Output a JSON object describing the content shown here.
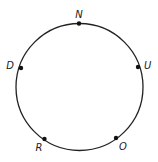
{
  "diagram": {
    "type": "circle-with-labeled-points",
    "circle": {
      "cx": 79.5,
      "cy": 87,
      "r": 63.5,
      "stroke": "#222222"
    },
    "points": [
      {
        "label": "N",
        "x": 79,
        "y": 23.5,
        "lx": 79,
        "ly": 18,
        "anchor": "middle"
      },
      {
        "label": "D",
        "x": 21,
        "y": 68,
        "lx": 14,
        "ly": 69,
        "anchor": "end"
      },
      {
        "label": "U",
        "x": 138,
        "y": 67,
        "lx": 144,
        "ly": 69,
        "anchor": "start"
      },
      {
        "label": "R",
        "x": 44.5,
        "y": 139,
        "lx": 39,
        "ly": 151,
        "anchor": "middle"
      },
      {
        "label": "O",
        "x": 116,
        "y": 138,
        "lx": 123,
        "ly": 150,
        "anchor": "middle"
      }
    ]
  }
}
